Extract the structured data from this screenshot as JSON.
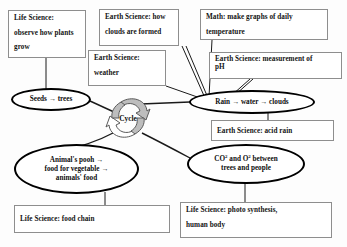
{
  "diagram": {
    "colors": {
      "background": "#fdfdfd",
      "box_border": "#8e8e8e",
      "ellipse_border": "#000000",
      "connector": "#1a1a1a",
      "cycle_arrow_fill": "#bdbdbd",
      "text": "#141414"
    },
    "boxes": [
      {
        "name": "life-science-observe-plants",
        "lines": [
          "Life Science:",
          "observe how plants",
          "grow"
        ]
      },
      {
        "name": "earth-science-clouds-formed",
        "lines": [
          "Earth Science: how",
          "clouds are formed"
        ]
      },
      {
        "name": "earth-science-weather",
        "lines": [
          "Earth Science:",
          "weather"
        ]
      },
      {
        "name": "math-graphs-temperature",
        "lines": [
          "Math: make graphs of daily",
          "temperature"
        ]
      },
      {
        "name": "earth-science-measurement-ph",
        "lines": [
          "Earth Science: measurement of",
          "pH"
        ]
      },
      {
        "name": "earth-science-acid-rain",
        "lines": [
          "Earth Science: acid rain"
        ]
      },
      {
        "name": "life-science-food-chain",
        "lines": [
          "Life Science: food chain"
        ]
      },
      {
        "name": "life-science-photosynthesis",
        "lines": [
          "Life Science: photo synthesis,",
          "human body"
        ]
      }
    ],
    "ellipses": [
      {
        "name": "seeds-trees",
        "lines": [
          "Seeds → trees"
        ]
      },
      {
        "name": "rain-water-clouds",
        "lines": [
          "Rain → water → clouds"
        ]
      },
      {
        "name": "animals-pooh-food",
        "lines": [
          "Animal's pooh →",
          "food for vegetable →",
          "animals' food"
        ]
      },
      {
        "name": "co2-o2-trees-people",
        "lines": [
          "CO2 and O2 between",
          "trees and people"
        ]
      }
    ],
    "center": {
      "label": "Cycle",
      "icon": "recycle-cycle-arrows-icon"
    }
  }
}
